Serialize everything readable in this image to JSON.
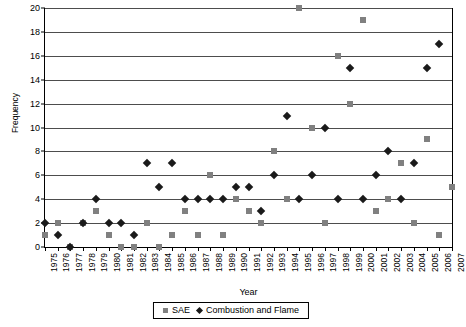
{
  "chart_data": {
    "type": "scatter",
    "title": "",
    "xlabel": "Year",
    "ylabel": "Frequency",
    "xlim": [
      1975,
      2007
    ],
    "ylim": [
      0,
      20
    ],
    "ytick_step": 2,
    "grid": true,
    "legend_position": "bottom",
    "x": [
      1975,
      1976,
      1977,
      1978,
      1979,
      1980,
      1981,
      1982,
      1983,
      1984,
      1985,
      1986,
      1987,
      1988,
      1989,
      1990,
      1991,
      1992,
      1993,
      1994,
      1995,
      1996,
      1997,
      1998,
      1999,
      2000,
      2001,
      2002,
      2003,
      2004,
      2005,
      2006,
      2007
    ],
    "categories": [
      "1975",
      "1976",
      "1977",
      "1978",
      "1979",
      "1980",
      "1981",
      "1982",
      "1983",
      "1984",
      "1985",
      "1986",
      "1987",
      "1988",
      "1989",
      "1990",
      "1991",
      "1992",
      "1993",
      "1994",
      "1995",
      "1996",
      "1997",
      "1998",
      "1999",
      "2000",
      "2001",
      "2002",
      "2003",
      "2004",
      "2005",
      "2006",
      "2007"
    ],
    "yticks": [
      0,
      2,
      4,
      6,
      8,
      10,
      12,
      14,
      16,
      18,
      20
    ],
    "series": [
      {
        "name": "SAE",
        "marker": "square",
        "color": "#808080",
        "values": [
          1,
          2,
          0,
          2,
          3,
          1,
          0,
          0,
          2,
          0,
          1,
          3,
          1,
          6,
          1,
          4,
          3,
          2,
          8,
          4,
          20,
          10,
          2,
          16,
          12,
          19,
          3,
          4,
          7,
          2,
          9,
          1,
          5
        ]
      },
      {
        "name": "Combustion and Flame",
        "marker": "diamond",
        "color": "#1a1a1a",
        "values": [
          2,
          1,
          0,
          2,
          4,
          2,
          2,
          1,
          7,
          5,
          7,
          4,
          4,
          4,
          4,
          5,
          5,
          3,
          6,
          11,
          4,
          6,
          10,
          4,
          15,
          4,
          6,
          8,
          4,
          7,
          15,
          17,
          null
        ]
      }
    ]
  },
  "legend": {
    "items": [
      {
        "label": "SAE",
        "marker": "square"
      },
      {
        "label": "Combustion and Flame",
        "marker": "diamond"
      }
    ]
  }
}
